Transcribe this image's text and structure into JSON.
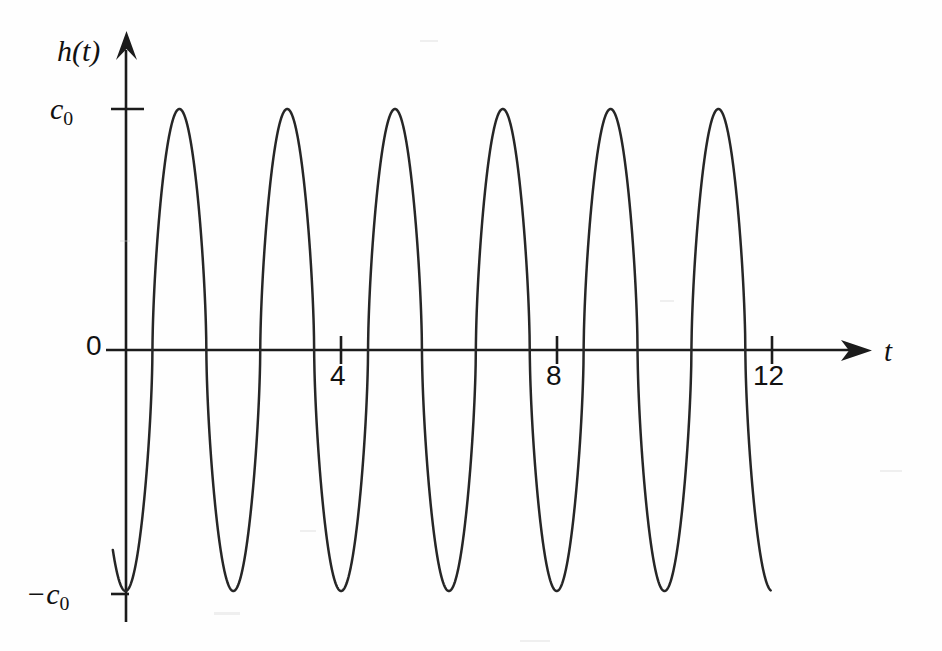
{
  "figure": {
    "background_color": "#fefefe",
    "ink_color": "#1b1b1b",
    "curve_color": "#262626",
    "width": 942,
    "height": 651
  },
  "labels": {
    "y_axis": "h(t)",
    "x_axis": "t",
    "y_max": "c",
    "y_max_sub": "0",
    "y_min_prefix": "−c",
    "y_min_sub": "0",
    "origin": "0"
  },
  "chart_data": {
    "type": "line",
    "title": "",
    "subtitle": "",
    "xlabel": "t",
    "ylabel": "h(t)",
    "grid": false,
    "legend": null,
    "xlim": [
      -0.25,
      13.7
    ],
    "ylim": [
      -1.32,
      1.62
    ],
    "x_ticks": [
      4,
      8,
      12
    ],
    "x_tick_labels": [
      "4",
      "8",
      "12"
    ],
    "y_ticks": [
      -1,
      0,
      1
    ],
    "y_tick_labels": [
      "−c₀",
      "0",
      "c₀"
    ],
    "amplitude_label_positive": "c₀",
    "amplitude_label_negative": "−c₀",
    "period": 2,
    "cycles_shown": 6,
    "waveform": "sharpened cosine: h(t) = -c0 * sign(cos(pi*t)) * |cos(pi*t)|^0.62",
    "series": [
      {
        "name": "h(t)",
        "x_start": -0.235,
        "x_end": 11.97,
        "peak_positions_t": [
          0.96,
          2.93,
          4.94,
          6.9,
          8.88,
          10.86
        ],
        "peak_value": "c₀",
        "trough_positions_t": [
          -0.235,
          2.03,
          3.98,
          5.93,
          7.9,
          9.87,
          11.84
        ],
        "trough_value": "−c₀",
        "zero_crossings_t": [
          0.55,
          1.53,
          2.53,
          3.5,
          4.5,
          5.48,
          6.47,
          7.45,
          8.44,
          9.42,
          10.41,
          11.39
        ]
      }
    ]
  },
  "geometry": {
    "origin_px": {
      "x": 125.5,
      "y": 350
    },
    "x_unit_px": 53.9,
    "y_unit_px": 241,
    "y_axis_top_px": 37,
    "y_axis_bottom_px": 622,
    "x_axis_left_px": 106,
    "x_axis_right_px": 866
  }
}
